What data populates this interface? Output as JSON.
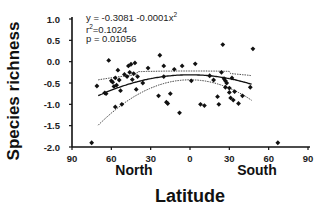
{
  "chart_data": {
    "type": "scatter",
    "title": "",
    "xlabel": "Latitude",
    "ylabel": "Species richness",
    "x_regions": [
      "North",
      "South"
    ],
    "xticks": [
      "90",
      "60",
      "30",
      "0",
      "30",
      "60",
      "90"
    ],
    "xlim": [
      -90,
      90
    ],
    "yticks": [
      "1.0",
      "0.5",
      "0.0",
      "-0.5",
      "-1.0",
      "-1.5",
      "-2.0"
    ],
    "ylim": [
      -2.0,
      1.0
    ],
    "grid": false,
    "legend": null,
    "annotations": {
      "equation": "y = -0.3081 -0.0001x",
      "equation_exp": "2",
      "r2_prefix": "r",
      "r2_exp": "2",
      "r2_value": "=0.1024",
      "p": "p = 0.01056"
    },
    "fit": {
      "model": "quadratic",
      "intercept": -0.3081,
      "a": -0.0001,
      "r2": 0.1024,
      "p": 0.01056,
      "confidence_band": true
    },
    "points": [
      {
        "x": -75,
        "y": -1.9
      },
      {
        "x": -71,
        "y": -0.57
      },
      {
        "x": -65,
        "y": -0.73
      },
      {
        "x": -64,
        "y": -0.75
      },
      {
        "x": -62,
        "y": 0.03
      },
      {
        "x": -60,
        "y": -0.45
      },
      {
        "x": -59,
        "y": -0.48
      },
      {
        "x": -58,
        "y": -0.58
      },
      {
        "x": -57,
        "y": -0.38
      },
      {
        "x": -57,
        "y": -1.06
      },
      {
        "x": -56,
        "y": -0.55
      },
      {
        "x": -55,
        "y": -0.2
      },
      {
        "x": -54,
        "y": -0.43
      },
      {
        "x": -53,
        "y": -0.68
      },
      {
        "x": -52,
        "y": -1.0
      },
      {
        "x": -50,
        "y": -0.3
      },
      {
        "x": -48,
        "y": -0.35
      },
      {
        "x": -47,
        "y": -0.1
      },
      {
        "x": -46,
        "y": -0.25
      },
      {
        "x": -45,
        "y": -0.06
      },
      {
        "x": -44,
        "y": -0.42
      },
      {
        "x": -43,
        "y": -0.28
      },
      {
        "x": -42,
        "y": -0.03
      },
      {
        "x": -41,
        "y": -0.65
      },
      {
        "x": -40,
        "y": -0.35
      },
      {
        "x": -36,
        "y": -0.5
      },
      {
        "x": -32,
        "y": -0.15
      },
      {
        "x": -24,
        "y": -0.8
      },
      {
        "x": -23,
        "y": 0.15
      },
      {
        "x": -20,
        "y": -0.35
      },
      {
        "x": -20,
        "y": -0.1
      },
      {
        "x": -18,
        "y": -0.95
      },
      {
        "x": -17,
        "y": -0.98
      },
      {
        "x": -15,
        "y": -0.75
      },
      {
        "x": -12,
        "y": -0.18
      },
      {
        "x": -8,
        "y": -1.2
      },
      {
        "x": -6,
        "y": -0.1
      },
      {
        "x": 1,
        "y": -0.45
      },
      {
        "x": 4,
        "y": -0.05
      },
      {
        "x": 8,
        "y": -1.0
      },
      {
        "x": 11,
        "y": -1.03
      },
      {
        "x": 15,
        "y": -0.33
      },
      {
        "x": 18,
        "y": -0.43
      },
      {
        "x": 21,
        "y": -0.82
      },
      {
        "x": 22,
        "y": -1.0
      },
      {
        "x": 24,
        "y": -0.25
      },
      {
        "x": 25,
        "y": 0.4
      },
      {
        "x": 26,
        "y": -0.4
      },
      {
        "x": 27,
        "y": -0.45
      },
      {
        "x": 27,
        "y": -0.6
      },
      {
        "x": 28,
        "y": -0.5
      },
      {
        "x": 30,
        "y": -0.62
      },
      {
        "x": 30,
        "y": -0.72
      },
      {
        "x": 31,
        "y": -0.85
      },
      {
        "x": 32,
        "y": -0.38
      },
      {
        "x": 33,
        "y": -0.9
      },
      {
        "x": 34,
        "y": -0.7
      },
      {
        "x": 37,
        "y": -0.98
      },
      {
        "x": 40,
        "y": -0.8
      },
      {
        "x": 46,
        "y": -0.6
      },
      {
        "x": 48,
        "y": 0.3
      },
      {
        "x": 67,
        "y": -1.9
      }
    ]
  }
}
